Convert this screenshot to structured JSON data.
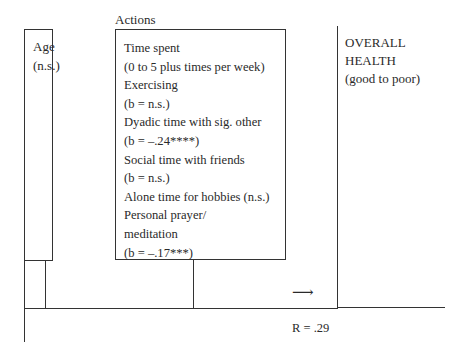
{
  "diagram": {
    "type": "path-model",
    "predictor": {
      "label": "Age",
      "stat": "(n.s.)"
    },
    "actions": {
      "title": "Actions",
      "items": [
        "Time spent",
        "(0 to 5 plus times per week)",
        "Exercising",
        "(b = n.s.)",
        "Dyadic time with sig. other",
        "(b = –.24****)",
        "Social  time with friends",
        "(b = n.s.)",
        "Alone time for hobbies (n.s.)",
        "Personal prayer/",
        "meditation",
        "(b = –.17***)"
      ]
    },
    "outcome": {
      "line1": "OVERALL",
      "line2": "HEALTH",
      "line3": "(good to poor)"
    },
    "arrow_icon": "right-arrow-icon",
    "arrow_glyph": "⟶",
    "r_value": "R = .29"
  }
}
